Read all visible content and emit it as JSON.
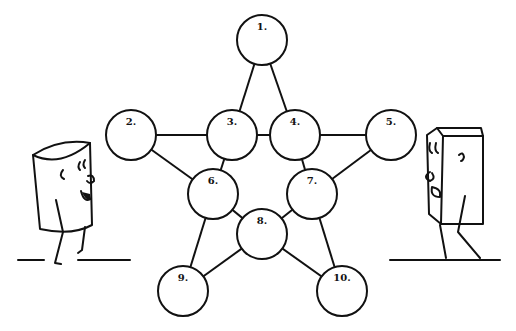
{
  "diagram": {
    "type": "star-graph",
    "nodes": [
      {
        "id": 1,
        "label": "1.",
        "x": 262,
        "y": 40
      },
      {
        "id": 2,
        "label": "2.",
        "x": 131,
        "y": 135
      },
      {
        "id": 3,
        "label": "3.",
        "x": 232,
        "y": 135
      },
      {
        "id": 4,
        "label": "4.",
        "x": 295,
        "y": 135
      },
      {
        "id": 5,
        "label": "5.",
        "x": 391,
        "y": 135
      },
      {
        "id": 6,
        "label": "6.",
        "x": 213,
        "y": 194
      },
      {
        "id": 7,
        "label": "7.",
        "x": 312,
        "y": 194
      },
      {
        "id": 8,
        "label": "8.",
        "x": 262,
        "y": 234
      },
      {
        "id": 9,
        "label": "9.",
        "x": 183,
        "y": 291
      },
      {
        "id": 10,
        "label": "10.",
        "x": 342,
        "y": 291
      }
    ],
    "edges": [
      [
        1,
        3
      ],
      [
        1,
        4
      ],
      [
        2,
        3
      ],
      [
        3,
        4
      ],
      [
        4,
        5
      ],
      [
        2,
        6
      ],
      [
        3,
        6
      ],
      [
        4,
        7
      ],
      [
        5,
        7
      ],
      [
        6,
        8
      ],
      [
        7,
        8
      ],
      [
        6,
        9
      ],
      [
        8,
        9
      ],
      [
        7,
        10
      ],
      [
        8,
        10
      ]
    ],
    "node_radius": 25,
    "characters": [
      {
        "name": "cylinder-character",
        "position": "left"
      },
      {
        "name": "box-character",
        "position": "right"
      }
    ]
  }
}
